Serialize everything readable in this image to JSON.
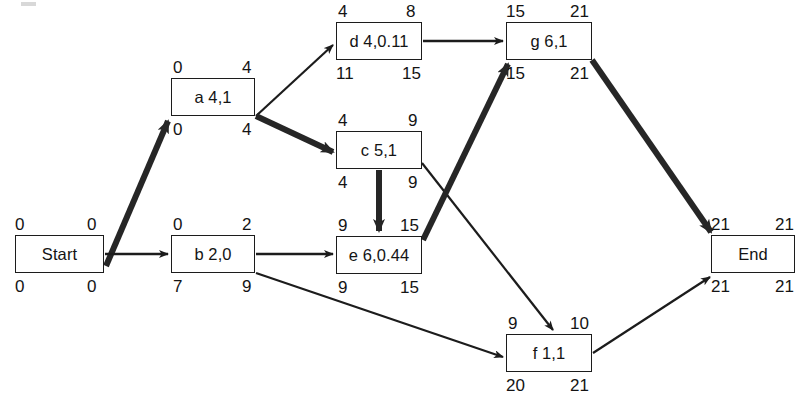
{
  "diagram": {
    "type": "activity-on-node-network",
    "canvas": {
      "width": 798,
      "height": 403
    },
    "colors": {
      "line": "#1c1c1c",
      "critical": "#262626",
      "text": "#141414",
      "background": "#ffffff"
    },
    "nodes": [
      {
        "id": "start",
        "label": "Start",
        "x": 15,
        "y": 235,
        "w": 89,
        "h": 38,
        "early_start": "0",
        "early_finish": "0",
        "late_start": "0",
        "late_finish": "0",
        "critical": true
      },
      {
        "id": "a",
        "label": "a 4,1",
        "x": 171,
        "y": 78,
        "w": 84,
        "h": 38,
        "early_start": "0",
        "early_finish": "4",
        "late_start": "0",
        "late_finish": "4",
        "critical": true
      },
      {
        "id": "b",
        "label": "b 2,0",
        "x": 171,
        "y": 235,
        "w": 84,
        "h": 38,
        "early_start": "0",
        "early_finish": "2",
        "late_start": "7",
        "late_finish": "9",
        "critical": false
      },
      {
        "id": "d",
        "label": "d 4,0.11",
        "x": 336,
        "y": 22,
        "w": 86,
        "h": 38,
        "early_start": "4",
        "early_finish": "8",
        "late_start": "11",
        "late_finish": "15",
        "critical": false
      },
      {
        "id": "c",
        "label": "c 5,1",
        "x": 336,
        "y": 131,
        "w": 86,
        "h": 38,
        "early_start": "4",
        "early_finish": "9",
        "late_start": "4",
        "late_finish": "9",
        "critical": true
      },
      {
        "id": "e",
        "label": "e 6,0.44",
        "x": 336,
        "y": 236,
        "w": 86,
        "h": 38,
        "early_start": "9",
        "early_finish": "15",
        "late_start": "9",
        "late_finish": "15",
        "critical": true
      },
      {
        "id": "g",
        "label": "g 6,1",
        "x": 506,
        "y": 22,
        "w": 86,
        "h": 38,
        "early_start": "15",
        "early_finish": "21",
        "late_start": "15",
        "late_finish": "21",
        "critical": true
      },
      {
        "id": "f",
        "label": "f 1,1",
        "x": 506,
        "y": 334,
        "w": 86,
        "h": 38,
        "early_start": "9",
        "early_finish": "10",
        "late_start": "20",
        "late_finish": "21",
        "critical": false
      },
      {
        "id": "end",
        "label": "End",
        "x": 711,
        "y": 235,
        "w": 84,
        "h": 38,
        "early_start": "21",
        "early_finish": "21",
        "late_start": "21",
        "late_finish": "21",
        "critical": true
      }
    ],
    "edges": [
      {
        "id": "start-a",
        "from": "start",
        "to": "a",
        "critical": true
      },
      {
        "id": "start-b",
        "from": "start",
        "to": "b",
        "critical": false
      },
      {
        "id": "a-d",
        "from": "a",
        "to": "d",
        "critical": false
      },
      {
        "id": "a-c",
        "from": "a",
        "to": "c",
        "critical": true
      },
      {
        "id": "b-e",
        "from": "b",
        "to": "e",
        "critical": false
      },
      {
        "id": "b-f",
        "from": "b",
        "to": "f",
        "critical": false
      },
      {
        "id": "d-g",
        "from": "d",
        "to": "g",
        "critical": false
      },
      {
        "id": "c-e",
        "from": "c",
        "to": "e",
        "critical": true
      },
      {
        "id": "c-f",
        "from": "c",
        "to": "f",
        "critical": false
      },
      {
        "id": "e-g",
        "from": "e",
        "to": "g",
        "critical": true
      },
      {
        "id": "g-end",
        "from": "g",
        "to": "end",
        "critical": true
      },
      {
        "id": "f-end",
        "from": "f",
        "to": "end",
        "critical": false
      }
    ]
  }
}
